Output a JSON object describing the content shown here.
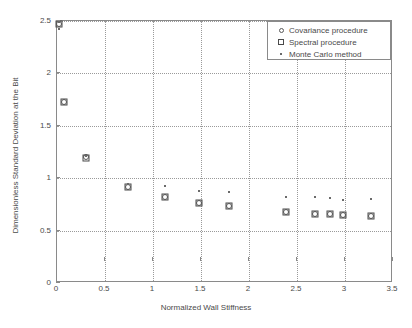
{
  "chart_data": {
    "type": "scatter",
    "title": "",
    "xlabel": "Normalized Wall Stiffness",
    "ylabel": "Dimensionless Standard Deviation at the Bit",
    "xlim": [
      0,
      3.5
    ],
    "ylim": [
      0,
      2.5
    ],
    "xticks": [
      "0",
      "0.5",
      "1",
      "1.5",
      "2",
      "2.5",
      "3",
      "3.5"
    ],
    "xtick_values": [
      0,
      0.5,
      1,
      1.5,
      2,
      2.5,
      3,
      3.5
    ],
    "yticks": [
      "0",
      "0.5",
      "1",
      "1.5",
      "2",
      "2.5"
    ],
    "ytick_values": [
      0,
      0.5,
      1,
      1.5,
      2,
      2.5
    ],
    "grid": true,
    "grid_style": "dotted",
    "legend_position": "top-right",
    "series": [
      {
        "name": "Covariance procedure",
        "marker": "circle",
        "color": "#5a5a5a",
        "points": [
          {
            "x": 0.02,
            "y": 2.47
          },
          {
            "x": 0.07,
            "y": 1.73
          },
          {
            "x": 0.3,
            "y": 1.2
          },
          {
            "x": 0.74,
            "y": 0.92
          },
          {
            "x": 1.12,
            "y": 0.82
          },
          {
            "x": 1.48,
            "y": 0.76
          },
          {
            "x": 1.79,
            "y": 0.73
          },
          {
            "x": 2.39,
            "y": 0.68
          },
          {
            "x": 2.69,
            "y": 0.66
          },
          {
            "x": 2.84,
            "y": 0.66
          },
          {
            "x": 2.98,
            "y": 0.65
          },
          {
            "x": 3.27,
            "y": 0.64
          }
        ]
      },
      {
        "name": "Spectral procedure",
        "marker": "square",
        "color": "#4a4a4a",
        "points": [
          {
            "x": 0.02,
            "y": 2.47
          },
          {
            "x": 0.07,
            "y": 1.73
          },
          {
            "x": 0.3,
            "y": 1.19
          },
          {
            "x": 0.74,
            "y": 0.92
          },
          {
            "x": 1.12,
            "y": 0.82
          },
          {
            "x": 1.48,
            "y": 0.76
          },
          {
            "x": 1.79,
            "y": 0.73
          },
          {
            "x": 2.39,
            "y": 0.68
          },
          {
            "x": 2.69,
            "y": 0.66
          },
          {
            "x": 2.84,
            "y": 0.66
          },
          {
            "x": 2.98,
            "y": 0.65
          },
          {
            "x": 3.27,
            "y": 0.64
          }
        ]
      },
      {
        "name": "Monte Carlo method",
        "marker": "dot",
        "color": "#6a6a6a",
        "points": [
          {
            "x": 0.02,
            "y": 2.49
          },
          {
            "x": 0.02,
            "y": 2.42
          },
          {
            "x": 0.3,
            "y": 1.21
          },
          {
            "x": 0.74,
            "y": 0.94
          },
          {
            "x": 1.12,
            "y": 0.93
          },
          {
            "x": 1.48,
            "y": 0.88
          },
          {
            "x": 1.79,
            "y": 0.87
          },
          {
            "x": 2.39,
            "y": 0.82
          },
          {
            "x": 2.69,
            "y": 0.82
          },
          {
            "x": 2.84,
            "y": 0.81
          },
          {
            "x": 2.98,
            "y": 0.79
          },
          {
            "x": 3.27,
            "y": 0.8
          }
        ]
      }
    ]
  }
}
